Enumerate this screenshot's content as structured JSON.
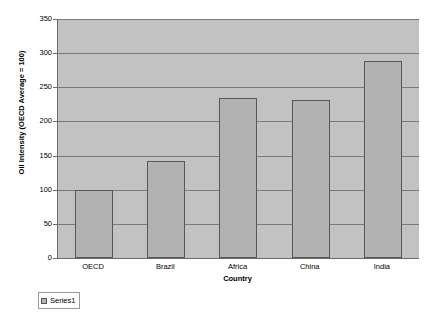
{
  "chart_data": {
    "type": "bar",
    "title": "",
    "subtitle": "",
    "categories": [
      "OECD",
      "Brazil",
      "Africa",
      "China",
      "India"
    ],
    "values": [
      100,
      142,
      234,
      231,
      288
    ],
    "series": [
      {
        "name": "Series1",
        "values": [
          100,
          142,
          234,
          231,
          288
        ]
      }
    ],
    "xlabel": "Country",
    "ylabel": "Oil Intensity (OECD Average = 100)",
    "ylim": [
      0,
      350
    ],
    "yticks": [
      0,
      50,
      100,
      150,
      200,
      250,
      300,
      350
    ],
    "ytick_labels": [
      "0",
      "50",
      "100",
      "150",
      "200",
      "250",
      "300",
      "350"
    ],
    "grid": true,
    "grid_axis": "y",
    "legend": {
      "position": "bottom-left",
      "entries": [
        "Series1"
      ]
    },
    "colors": {
      "bar_fill": "#b2b2b2",
      "bar_border": "#575757",
      "plot_background": "#c2c2c2",
      "gridline": "#7a7a7a",
      "axis": "#6b6b6b",
      "text": "#000000",
      "page_background": "#ffffff"
    }
  }
}
